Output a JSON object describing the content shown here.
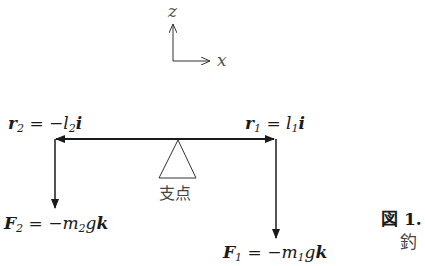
{
  "axes": {
    "z_label": "z",
    "x_label": "x"
  },
  "fulcrum": {
    "label": "支点"
  },
  "vectors": {
    "r2": {
      "sym": "r",
      "sub": "2",
      "eq": "=",
      "rhs_sign": "−",
      "rhs_var": "l",
      "rhs_sub": "2",
      "rhs_unit": "i"
    },
    "r1": {
      "sym": "r",
      "sub": "1",
      "eq": "=",
      "rhs_var": "l",
      "rhs_sub": "1",
      "rhs_unit": "i"
    },
    "F2": {
      "sym": "F",
      "sub": "2",
      "eq": "=",
      "rhs_sign": "−",
      "rhs_var": "m",
      "rhs_sub": "2",
      "rhs_g": "g",
      "rhs_unit": "k"
    },
    "F1": {
      "sym": "F",
      "sub": "1",
      "eq": "=",
      "rhs_sign": "−",
      "rhs_var": "m",
      "rhs_sub": "1",
      "rhs_g": "g",
      "rhs_unit": "k"
    }
  },
  "caption": {
    "fig": "図 1.",
    "text": "釣"
  }
}
